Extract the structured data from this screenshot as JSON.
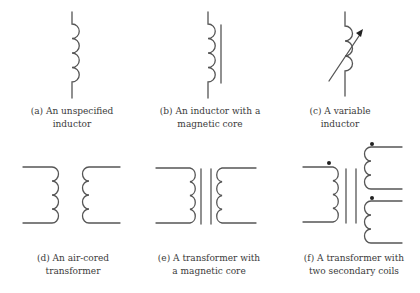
{
  "figure": {
    "panels": [
      {
        "id": "a",
        "symbol": "unspecified-inductor",
        "caption": [
          "(a) An unspecified",
          "inductor"
        ]
      },
      {
        "id": "b",
        "symbol": "inductor-magnetic-core",
        "caption": [
          "(b) An inductor with a",
          "magnetic core"
        ]
      },
      {
        "id": "c",
        "symbol": "variable-inductor",
        "caption": [
          "(c) A variable",
          "inductor"
        ]
      },
      {
        "id": "d",
        "symbol": "air-cored-transformer",
        "caption": [
          "(d) An air-cored",
          "transformer"
        ]
      },
      {
        "id": "e",
        "symbol": "transformer-magnetic-core",
        "caption": [
          "(e) A transformer with",
          "a magnetic core"
        ]
      },
      {
        "id": "f",
        "symbol": "transformer-two-secondaries",
        "caption": [
          "(f) A transformer with",
          "two secondary coils"
        ]
      }
    ],
    "colors": {
      "line": "#555555",
      "dot": "#222222",
      "text": "#3a3a3a"
    }
  }
}
